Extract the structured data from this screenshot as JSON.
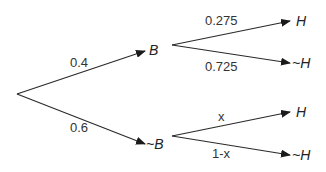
{
  "diagram": {
    "type": "probability-tree",
    "root": {
      "x": 17,
      "y": 94
    },
    "first_level": [
      {
        "id": "B",
        "label": "B",
        "probability_label": "0.4",
        "edge": {
          "x1": 17,
          "y1": 94,
          "x2": 145,
          "y2": 51
        },
        "label_pos": {
          "x": 149,
          "y": 55
        },
        "prob_pos": {
          "x": 70,
          "y": 67
        },
        "children_origin": {
          "x": 172,
          "y": 45
        },
        "children": [
          {
            "id": "B_H",
            "label": "H",
            "probability_label": "0.275",
            "edge": {
              "x1": 172,
              "y1": 45,
              "x2": 290,
              "y2": 21
            },
            "label_pos": {
              "x": 296,
              "y": 26
            },
            "prob_pos": {
              "x": 205,
              "y": 25
            }
          },
          {
            "id": "B_notH",
            "label": "~H",
            "probability_label": "0.725",
            "edge": {
              "x1": 172,
              "y1": 45,
              "x2": 290,
              "y2": 63
            },
            "label_pos": {
              "x": 292,
              "y": 68
            },
            "prob_pos": {
              "x": 205,
              "y": 71
            }
          }
        ]
      },
      {
        "id": "notB",
        "label": "~B",
        "probability_label": "0.6",
        "edge": {
          "x1": 17,
          "y1": 94,
          "x2": 145,
          "y2": 144
        },
        "label_pos": {
          "x": 146,
          "y": 149
        },
        "prob_pos": {
          "x": 70,
          "y": 132
        },
        "children_origin": {
          "x": 172,
          "y": 136
        },
        "children": [
          {
            "id": "notB_H",
            "label": "H",
            "probability_label": "x",
            "edge": {
              "x1": 172,
              "y1": 136,
              "x2": 290,
              "y2": 112
            },
            "label_pos": {
              "x": 296,
              "y": 117
            },
            "prob_pos": {
              "x": 218,
              "y": 121
            }
          },
          {
            "id": "notB_notH",
            "label": "~H",
            "probability_label": "1-x",
            "edge": {
              "x1": 172,
              "y1": 136,
              "x2": 290,
              "y2": 155
            },
            "label_pos": {
              "x": 292,
              "y": 160
            },
            "prob_pos": {
              "x": 212,
              "y": 158
            }
          }
        ]
      }
    ],
    "colors": {
      "line": "#2a2a2a",
      "text": "#333333",
      "background": "#ffffff"
    }
  }
}
